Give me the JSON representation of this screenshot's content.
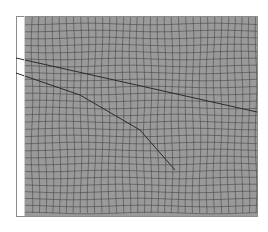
{
  "figure": {
    "colors": {
      "background": "#ffffff",
      "mesh_fill": "#9a9a9a",
      "mesh_lines": "#3a3a3a",
      "fault_lines": "#2a2a2a",
      "frame": "#8c8c8c"
    },
    "domain": {
      "x": 25,
      "y": 17,
      "width": 232,
      "height": 199
    },
    "frame": {
      "x": 16,
      "y": 16,
      "width": 241,
      "height": 200
    },
    "cell_size": 7,
    "faults": [
      {
        "name": "upper-fault",
        "points": [
          [
            16,
            58
          ],
          [
            257,
            112
          ]
        ]
      },
      {
        "name": "lower-fault",
        "points": [
          [
            16,
            73
          ],
          [
            80,
            95
          ],
          [
            140,
            130
          ],
          [
            175,
            170
          ]
        ]
      }
    ]
  }
}
